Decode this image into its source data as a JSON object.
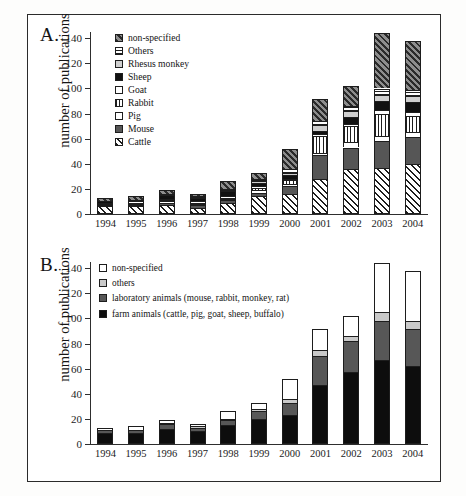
{
  "figure": {
    "axis_label": "number of publications",
    "years": [
      "1994",
      "1995",
      "1996",
      "1997",
      "1998",
      "1999",
      "2000",
      "2001",
      "2002",
      "2003",
      "2004"
    ],
    "ytick_labels": [
      "0",
      "20",
      "40",
      "60",
      "80",
      "100",
      "120",
      "140"
    ]
  },
  "panel_a": {
    "letter": "A.",
    "legend": [
      {
        "key": "nonspec",
        "label": "non-specified"
      },
      {
        "key": "others",
        "label": "Others"
      },
      {
        "key": "rhesus",
        "label": "Rhesus monkey"
      },
      {
        "key": "sheep",
        "label": "Sheep"
      },
      {
        "key": "goat",
        "label": "Goat"
      },
      {
        "key": "rabbit",
        "label": "Rabbit"
      },
      {
        "key": "pig",
        "label": "Pig"
      },
      {
        "key": "mouse",
        "label": "Mouse"
      },
      {
        "key": "cattle",
        "label": "Cattle"
      }
    ]
  },
  "panel_b": {
    "letter": "B.",
    "legend": [
      {
        "key": "nonspec",
        "label": "non-specified"
      },
      {
        "key": "others",
        "label": "others"
      },
      {
        "key": "lab",
        "label": "laboratory animals (mouse, rabbit, monkey, rat)"
      },
      {
        "key": "farm",
        "label": "farm animals (cattle, pig, goat, sheep, buffalo)"
      }
    ]
  },
  "chart_data": [
    {
      "type": "bar",
      "id": "panel-a",
      "stacked": true,
      "title": "A.",
      "xlabel": "",
      "ylabel": "number of publications",
      "ylim": [
        0,
        145
      ],
      "yticks": [
        0,
        20,
        40,
        60,
        80,
        100,
        120,
        140
      ],
      "grid": false,
      "legend_position": "top-left",
      "categories": [
        "1994",
        "1995",
        "1996",
        "1997",
        "1998",
        "1999",
        "2000",
        "2001",
        "2002",
        "2003",
        "2004"
      ],
      "series": [
        {
          "name": "Cattle",
          "values": [
            6,
            6,
            7,
            5,
            9,
            14,
            16,
            28,
            36,
            37,
            40
          ]
        },
        {
          "name": "Mouse",
          "values": [
            1,
            1,
            2,
            2,
            2,
            3,
            6,
            19,
            17,
            21,
            21
          ]
        },
        {
          "name": "Pig",
          "values": [
            1,
            1,
            1,
            1,
            1,
            2,
            2,
            2,
            4,
            4,
            4
          ]
        },
        {
          "name": "Rabbit",
          "values": [
            1,
            1,
            1,
            1,
            1,
            2,
            3,
            13,
            13,
            18,
            13
          ]
        },
        {
          "name": "Goat",
          "values": [
            0,
            1,
            1,
            1,
            1,
            1,
            1,
            2,
            2,
            3,
            3
          ]
        },
        {
          "name": "Sheep",
          "values": [
            1,
            1,
            3,
            3,
            4,
            3,
            3,
            2,
            5,
            7,
            8
          ]
        },
        {
          "name": "Rhesus monkey",
          "values": [
            0,
            0,
            0,
            0,
            1,
            1,
            2,
            5,
            5,
            5,
            5
          ]
        },
        {
          "name": "Others",
          "values": [
            0,
            0,
            1,
            1,
            1,
            2,
            3,
            3,
            4,
            5,
            5
          ]
        },
        {
          "name": "non-specified",
          "values": [
            3,
            3,
            3,
            2,
            6,
            5,
            16,
            18,
            16,
            44,
            39
          ]
        }
      ],
      "totals": [
        13,
        14,
        19,
        16,
        26,
        33,
        52,
        92,
        102,
        144,
        138
      ]
    },
    {
      "type": "bar",
      "id": "panel-b",
      "stacked": true,
      "title": "B.",
      "xlabel": "",
      "ylabel": "number of publications",
      "ylim": [
        0,
        145
      ],
      "yticks": [
        0,
        20,
        40,
        60,
        80,
        100,
        120,
        140
      ],
      "grid": false,
      "legend_position": "top-left",
      "categories": [
        "1994",
        "1995",
        "1996",
        "1997",
        "1998",
        "1999",
        "2000",
        "2001",
        "2002",
        "2003",
        "2004"
      ],
      "series": [
        {
          "name": "farm animals (cattle, pig, goat, sheep, buffalo)",
          "values": [
            9,
            9,
            12,
            10,
            15,
            20,
            23,
            47,
            57,
            67,
            62
          ]
        },
        {
          "name": "laboratory animals (mouse, rabbit, monkey, rat)",
          "values": [
            2,
            2,
            4,
            3,
            4,
            6,
            10,
            23,
            25,
            31,
            30
          ]
        },
        {
          "name": "others",
          "values": [
            0,
            0,
            1,
            1,
            1,
            2,
            3,
            5,
            4,
            7,
            6
          ]
        },
        {
          "name": "non-specified",
          "values": [
            2,
            3,
            2,
            2,
            6,
            5,
            16,
            17,
            16,
            39,
            40
          ]
        }
      ],
      "totals": [
        13,
        14,
        19,
        16,
        26,
        33,
        52,
        92,
        102,
        144,
        138
      ]
    }
  ]
}
